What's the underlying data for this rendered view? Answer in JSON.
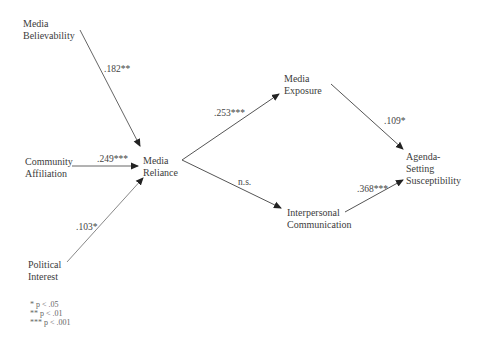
{
  "nodes": {
    "media_believability": {
      "line1": "Media",
      "line2": "Believability"
    },
    "community_affiliation": {
      "line1": "Community",
      "line2": "Affiliation"
    },
    "political_interest": {
      "line1": "Political",
      "line2": "Interest"
    },
    "media_reliance": {
      "line1": "Media",
      "line2": "Reliance"
    },
    "media_exposure": {
      "line1": "Media",
      "line2": "Exposure"
    },
    "interpersonal_communication": {
      "line1": "Interpersonal",
      "line2": "Communication"
    },
    "agenda_setting": {
      "line1": "Agenda-",
      "line2": "Setting",
      "line3": "Susceptibility"
    }
  },
  "paths": [
    {
      "from": "Media Believability",
      "to": "Media Reliance",
      "coef": ".182**"
    },
    {
      "from": "Community Affiliation",
      "to": "Media Reliance",
      "coef": ".249***"
    },
    {
      "from": "Political Interest",
      "to": "Media Reliance",
      "coef": ".103*"
    },
    {
      "from": "Media Reliance",
      "to": "Media Exposure",
      "coef": ".253***"
    },
    {
      "from": "Media Reliance",
      "to": "Interpersonal Communication",
      "coef": "n.s."
    },
    {
      "from": "Media Exposure",
      "to": "Agenda-Setting Susceptibility",
      "coef": ".109*"
    },
    {
      "from": "Interpersonal Communication",
      "to": "Agenda-Setting Susceptibility",
      "coef": ".368***"
    }
  ],
  "legend": [
    "* p < .05",
    "** p < .01",
    "*** p < .001"
  ]
}
